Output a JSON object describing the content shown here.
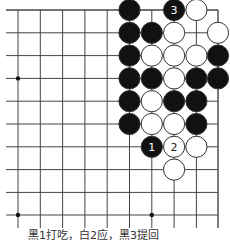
{
  "diagram": {
    "type": "go-board-fragment",
    "grid": {
      "columns_x": [
        18,
        40.3,
        62.6,
        84.9,
        107.2,
        129.5,
        151.8,
        174.1,
        196.4,
        218
      ],
      "rows_y": [
        10,
        32.8,
        55.6,
        78.4,
        101.2,
        124,
        146.8,
        169.6,
        192.4,
        215
      ],
      "left_edge_open": true,
      "bottom_edge_open": true,
      "top_edge_board": true,
      "right_edge_board": true,
      "line_color": "#444444"
    },
    "star_points": [
      {
        "col": 0,
        "row": 3
      },
      {
        "col": 0,
        "row": 9
      },
      {
        "col": 6,
        "row": 9
      }
    ],
    "stones": [
      {
        "col": 5,
        "row": 0,
        "color": "black"
      },
      {
        "col": 7,
        "row": 0,
        "color": "black",
        "label": "3"
      },
      {
        "col": 8,
        "row": 0,
        "color": "white"
      },
      {
        "col": 5,
        "row": 1,
        "color": "black"
      },
      {
        "col": 6,
        "row": 1,
        "color": "black"
      },
      {
        "col": 7,
        "row": 1,
        "color": "white"
      },
      {
        "col": 9,
        "row": 1,
        "color": "white"
      },
      {
        "col": 5,
        "row": 2,
        "color": "black"
      },
      {
        "col": 6,
        "row": 2,
        "color": "white"
      },
      {
        "col": 7,
        "row": 2,
        "color": "white"
      },
      {
        "col": 8,
        "row": 2,
        "color": "white"
      },
      {
        "col": 9,
        "row": 2,
        "color": "black"
      },
      {
        "col": 5,
        "row": 3,
        "color": "black"
      },
      {
        "col": 6,
        "row": 3,
        "color": "black"
      },
      {
        "col": 7,
        "row": 3,
        "color": "white"
      },
      {
        "col": 8,
        "row": 3,
        "color": "black"
      },
      {
        "col": 9,
        "row": 3,
        "color": "black"
      },
      {
        "col": 5,
        "row": 4,
        "color": "black"
      },
      {
        "col": 6,
        "row": 4,
        "color": "white"
      },
      {
        "col": 7,
        "row": 4,
        "color": "black"
      },
      {
        "col": 8,
        "row": 4,
        "color": "black"
      },
      {
        "col": 5,
        "row": 5,
        "color": "black"
      },
      {
        "col": 6,
        "row": 5,
        "color": "white"
      },
      {
        "col": 7,
        "row": 5,
        "color": "white"
      },
      {
        "col": 8,
        "row": 5,
        "color": "black"
      },
      {
        "col": 6,
        "row": 6,
        "color": "black",
        "label": "1"
      },
      {
        "col": 7,
        "row": 6,
        "color": "white",
        "label": "2"
      },
      {
        "col": 8,
        "row": 6,
        "color": "white"
      },
      {
        "col": 7,
        "row": 7,
        "color": "white"
      }
    ],
    "colors": {
      "black_stone": "#111111",
      "white_stone": "#ffffff",
      "stone_outline": "#333333",
      "label_on_black": "#ffffff",
      "label_on_white": "#222222"
    }
  },
  "caption": "黑1打吃，白2应，黑3提回"
}
